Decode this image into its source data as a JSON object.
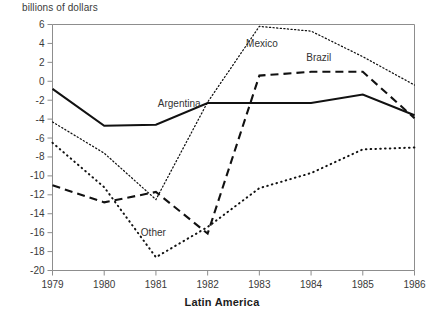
{
  "chart_data": {
    "type": "line",
    "title": "Latin America",
    "xlabel": "",
    "ylabel": "billions of dollars",
    "x": [
      1979,
      1980,
      1981,
      1982,
      1983,
      1984,
      1985,
      1986
    ],
    "xticklabels": [
      "1979",
      "1980",
      "1981",
      "1982",
      "1983",
      "1984",
      "1985",
      "1986"
    ],
    "yticklabels": [
      "6",
      "4",
      "2",
      "0",
      "-2",
      "-4",
      "-6",
      "-8",
      "-10",
      "-12",
      "-14",
      "-16",
      "-18",
      "-20"
    ],
    "yticks": [
      6,
      4,
      2,
      0,
      -2,
      -4,
      -6,
      -8,
      -10,
      -12,
      -14,
      -16,
      -18,
      -20
    ],
    "xlim": [
      1979,
      1986
    ],
    "ylim": [
      -20,
      6
    ],
    "grid": false,
    "legend_position": "inline-annotations",
    "series": [
      {
        "name": "Argentina",
        "style": "solid",
        "label_x": 1981.45,
        "label_y": -2.75,
        "values": [
          -0.8,
          -4.7,
          -4.6,
          -2.3,
          -2.3,
          -2.3,
          -1.4,
          -3.6
        ]
      },
      {
        "name": "Mexico",
        "style": "fine-dotted",
        "label_x": 1983.05,
        "label_y": 3.6,
        "values": [
          -4.3,
          -7.6,
          -12.5,
          -2.2,
          5.8,
          5.3,
          2.6,
          -0.4
        ]
      },
      {
        "name": "Brazil",
        "style": "dashed",
        "label_x": 1984.15,
        "label_y": 2.1,
        "values": [
          -11.0,
          -12.8,
          -11.7,
          -16.1,
          0.6,
          1.0,
          1.0,
          -3.9
        ]
      },
      {
        "name": "Other",
        "style": "coarse-dotted",
        "label_x": 1980.95,
        "label_y": -16.4,
        "values": [
          -6.5,
          -11.2,
          -18.6,
          -15.4,
          -11.3,
          -9.7,
          -7.2,
          -7.0
        ]
      }
    ]
  }
}
